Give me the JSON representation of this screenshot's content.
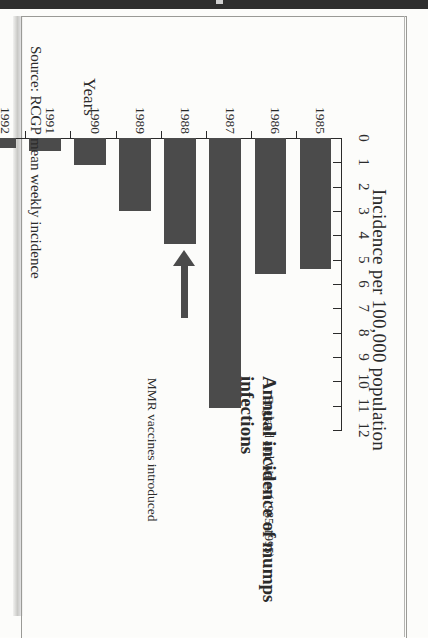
{
  "figure": {
    "title": "Annual incidence of mumps infections",
    "subtitle": "England and Wales (1985-1995)",
    "value_axis_title": "Incidence per 100,000 population",
    "category_axis_title": "Years",
    "source": "Source: RCGP mean weekly incidence",
    "annotation": "MMR vaccines introduced",
    "bar_color": "#4b4b4b",
    "axis_color": "#2b2b2b",
    "page_band_color": "#2e2e2e"
  },
  "chart_data": {
    "type": "bar",
    "orientation": "horizontal",
    "title": "Annual incidence of mumps infections",
    "subtitle": "England and Wales (1985-1995)",
    "xlabel": "Incidence per 100,000 population",
    "ylabel": "Years",
    "categories": [
      "1985",
      "1986",
      "1987",
      "1988",
      "1989",
      "1990",
      "1991",
      "1992",
      "1993",
      "1994",
      "1995"
    ],
    "values": [
      5.4,
      5.6,
      11.1,
      4.35,
      3.0,
      1.1,
      0.55,
      0.4,
      0.3,
      0.35,
      0.25
    ],
    "xlim": [
      0,
      12
    ],
    "xticks": [
      0,
      1,
      2,
      3,
      4,
      5,
      6,
      7,
      8,
      9,
      10,
      11,
      12
    ],
    "xtick_labels": [
      "0",
      "1",
      "2",
      "3",
      "4",
      "5",
      "6",
      "7",
      "8",
      "9",
      "10",
      "11",
      "12"
    ],
    "grid": false,
    "legend": null,
    "annotations": [
      {
        "text": "MMR vaccines introduced",
        "points_to_category": "1988",
        "arrow": true
      }
    ],
    "source_note": "Source: RCGP mean weekly incidence"
  }
}
